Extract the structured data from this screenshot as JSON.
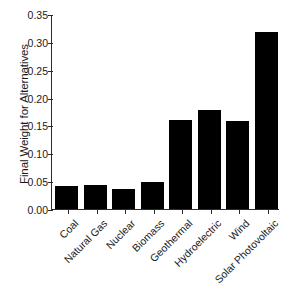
{
  "chart_data": {
    "type": "bar",
    "title": "",
    "xlabel": "",
    "ylabel": "Final Weight for Alternatives",
    "categories": [
      "Coal",
      "Natural Gas",
      "Nuclear",
      "Biomass",
      "Geothermal",
      "Hydroelectric",
      "Wind",
      "Solar Photovoltaic"
    ],
    "values": [
      0.041,
      0.044,
      0.036,
      0.049,
      0.159,
      0.178,
      0.158,
      0.317
    ],
    "ylim": [
      0.0,
      0.35
    ],
    "ytick_values": [
      0.0,
      0.05,
      0.1,
      0.15,
      0.2,
      0.25,
      0.3,
      0.35
    ],
    "ytick_labels": [
      "0.00",
      "0.05",
      "0.10",
      "0.15",
      "0.20",
      "0.25",
      "0.30",
      "0.35"
    ],
    "grid": false,
    "legend": false,
    "bar_color": "#000000",
    "axis_color": "#2b2b2b",
    "background_color": "#ffffff",
    "xlabel_rotation": -45
  }
}
